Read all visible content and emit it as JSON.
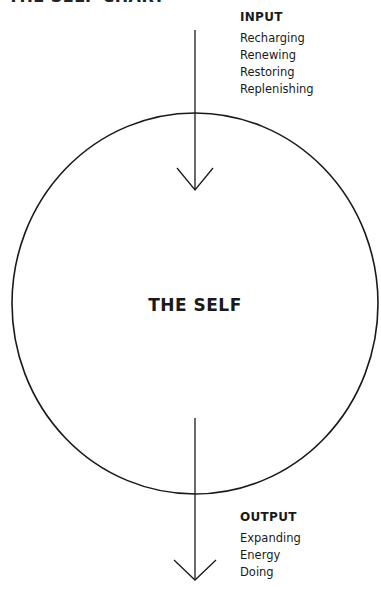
{
  "title": "THE SELF CHART",
  "center_label": "THE SELF",
  "input": {
    "heading": "INPUT",
    "items": [
      "Recharging",
      "Renewing",
      "Restoring",
      "Replenishing"
    ]
  },
  "output": {
    "heading": "OUTPUT",
    "items": [
      "Expanding",
      "Energy",
      "Doing"
    ]
  },
  "colors": {
    "stroke": "#1a1a1a",
    "background": "#ffffff"
  }
}
